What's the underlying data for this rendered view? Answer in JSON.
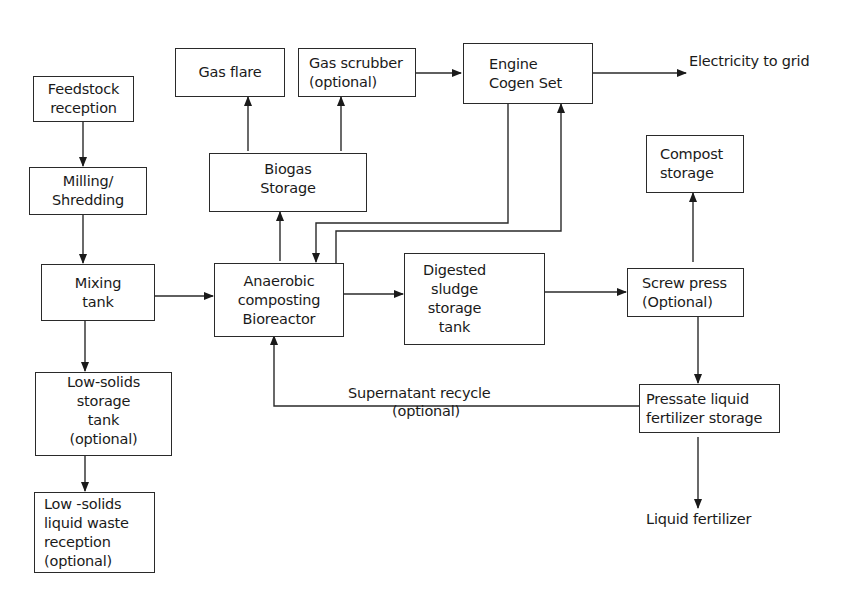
{
  "diagram": {
    "nodes": {
      "feedstock": {
        "lines": [
          "Feedstock",
          "reception"
        ]
      },
      "milling": {
        "lines": [
          "Milling/",
          "Shredding"
        ]
      },
      "gas_flare": {
        "lines": [
          "Gas flare"
        ]
      },
      "gas_scrubber": {
        "lines": [
          "Gas scrubber",
          "(optional)"
        ]
      },
      "engine": {
        "lines": [
          "Engine",
          "Cogen Set"
        ]
      },
      "biogas": {
        "lines": [
          "Biogas",
          "Storage"
        ]
      },
      "compost": {
        "lines": [
          "Compost",
          "storage"
        ]
      },
      "mixing": {
        "lines": [
          "Mixing",
          "tank"
        ]
      },
      "anaerobic": {
        "lines": [
          "Anaerobic",
          "composting",
          "Bioreactor"
        ]
      },
      "digested": {
        "lines": [
          "Digested",
          "sludge",
          "storage",
          "tank"
        ]
      },
      "screw_press": {
        "lines": [
          "Screw press",
          "(Optional)"
        ]
      },
      "low_solids_storage": {
        "lines": [
          "Low-solids",
          "storage",
          "tank",
          "(optional)"
        ]
      },
      "pressate": {
        "lines": [
          "Pressate liquid",
          "fertilizer storage"
        ]
      },
      "low_solids_liquid": {
        "lines": [
          "Low -solids",
          "liquid waste",
          "reception",
          "(optional)"
        ]
      }
    },
    "labels": {
      "electricity": "Electricity to grid",
      "liquid_fertilizer": "Liquid fertilizer",
      "supernatant": "Supernatant recycle",
      "supernatant_optional": "(optional)"
    },
    "edges": [
      {
        "from": "Feedstock reception",
        "to": "Milling/Shredding"
      },
      {
        "from": "Milling/Shredding",
        "to": "Mixing tank"
      },
      {
        "from": "Mixing tank",
        "to": "Anaerobic composting Bioreactor"
      },
      {
        "from": "Mixing tank",
        "to": "Low-solids storage tank (optional)"
      },
      {
        "from": "Low-solids storage tank (optional)",
        "to": "Low -solids liquid waste reception (optional)"
      },
      {
        "from": "Anaerobic composting Bioreactor",
        "to": "Biogas Storage"
      },
      {
        "from": "Biogas Storage",
        "to": "Gas flare"
      },
      {
        "from": "Biogas Storage",
        "to": "Gas scrubber (optional)"
      },
      {
        "from": "Gas scrubber (optional)",
        "to": "Engine Cogen Set"
      },
      {
        "from": "Engine Cogen Set",
        "to": "Electricity to grid"
      },
      {
        "from": "Engine Cogen Set",
        "to": "Anaerobic composting Bioreactor"
      },
      {
        "from": "Anaerobic composting Bioreactor",
        "to": "Engine Cogen Set"
      },
      {
        "from": "Anaerobic composting Bioreactor",
        "to": "Digested sludge storage tank"
      },
      {
        "from": "Digested sludge storage tank",
        "to": "Screw press (Optional)"
      },
      {
        "from": "Screw press (Optional)",
        "to": "Compost storage"
      },
      {
        "from": "Screw press (Optional)",
        "to": "Pressate liquid fertilizer storage"
      },
      {
        "from": "Pressate liquid fertilizer storage",
        "to": "Liquid fertilizer"
      },
      {
        "from": "Pressate liquid fertilizer storage",
        "to": "Anaerobic composting Bioreactor",
        "label": "Supernatant recycle (optional)"
      }
    ]
  }
}
